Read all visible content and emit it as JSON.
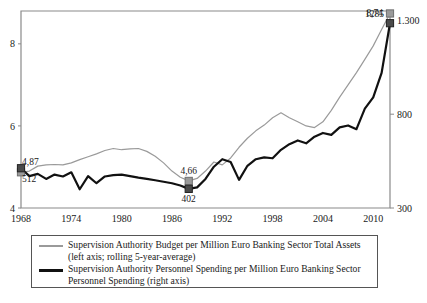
{
  "chart_data": {
    "type": "line",
    "title": "",
    "subtitle": "",
    "xlabel": "",
    "ylabel": "",
    "grid": false,
    "legend_position": "bottom",
    "xlim": [
      1968,
      2012
    ],
    "x_ticks": [
      1968,
      1974,
      1980,
      1986,
      1992,
      1998,
      2004,
      2010
    ],
    "x_tick_labels": [
      "1968",
      "1974",
      "1980",
      "1986",
      "1992",
      "1998",
      "2004",
      "2010"
    ],
    "left_axis": {
      "ylim": [
        4,
        8.8
      ],
      "ticks": [
        4,
        6,
        8
      ],
      "tick_labels": [
        "4",
        "6",
        "8"
      ]
    },
    "right_axis": {
      "ylim": [
        300,
        1350
      ],
      "ticks": [
        300,
        800,
        1300
      ],
      "tick_labels": [
        "300",
        "800",
        "1.300"
      ]
    },
    "series": [
      {
        "name": "Supervision Authority Budget per Million Euro Banking Sector Total Assets",
        "axis": "left",
        "color": "#9a9a9a",
        "x": [
          1968,
          1969,
          1970,
          1971,
          1972,
          1973,
          1974,
          1975,
          1976,
          1977,
          1978,
          1979,
          1980,
          1981,
          1982,
          1983,
          1984,
          1985,
          1986,
          1987,
          1988,
          1989,
          1990,
          1991,
          1992,
          1993,
          1994,
          1995,
          1996,
          1997,
          1998,
          1999,
          2000,
          2001,
          2002,
          2003,
          2004,
          2005,
          2006,
          2007,
          2008,
          2009,
          2010,
          2011,
          2012
        ],
        "values": [
          4.87,
          4.9,
          5.02,
          5.05,
          5.06,
          5.05,
          5.1,
          5.18,
          5.25,
          5.32,
          5.4,
          5.45,
          5.42,
          5.44,
          5.45,
          5.38,
          5.26,
          5.1,
          4.9,
          4.75,
          4.66,
          4.72,
          4.9,
          5.12,
          5.05,
          5.22,
          5.48,
          5.7,
          5.88,
          6.02,
          6.2,
          6.32,
          6.2,
          6.1,
          6.0,
          5.96,
          6.1,
          6.38,
          6.7,
          7.0,
          7.3,
          7.62,
          7.95,
          8.35,
          8.74
        ]
      },
      {
        "name": "Supervision Authority Personnel Spending per Million Euro Banking Sector Personnel Spending",
        "axis": "right",
        "color": "#111111",
        "x": [
          1968,
          1969,
          1970,
          1971,
          1972,
          1973,
          1974,
          1975,
          1976,
          1977,
          1978,
          1979,
          1980,
          1981,
          1982,
          1983,
          1984,
          1985,
          1986,
          1987,
          1988,
          1989,
          1990,
          1991,
          1992,
          1993,
          1994,
          1995,
          1996,
          1997,
          1998,
          1999,
          2000,
          2001,
          2002,
          2003,
          2004,
          2005,
          2006,
          2007,
          2008,
          2009,
          2010,
          2011,
          2012
        ],
        "values": [
          512,
          470,
          482,
          455,
          478,
          468,
          490,
          400,
          470,
          432,
          468,
          475,
          478,
          470,
          462,
          455,
          448,
          440,
          432,
          420,
          402,
          410,
          455,
          520,
          560,
          545,
          450,
          525,
          560,
          570,
          565,
          610,
          640,
          660,
          645,
          680,
          700,
          690,
          730,
          740,
          720,
          830,
          890,
          1020,
          1285
        ]
      }
    ],
    "annotations": [
      {
        "text": "4,87",
        "series": "left",
        "x": 1968,
        "value": 4.87,
        "marker": "gray-square",
        "label_pos": "above-right"
      },
      {
        "text": "512",
        "series": "right",
        "x": 1968,
        "value": 512,
        "marker": "dark-square",
        "label_pos": "below-right"
      },
      {
        "text": "4,66",
        "series": "left",
        "x": 1988,
        "value": 4.66,
        "marker": "gray-square",
        "label_pos": "above"
      },
      {
        "text": "402",
        "series": "right",
        "x": 1988,
        "value": 402,
        "marker": "dark-square",
        "label_pos": "below"
      },
      {
        "text": "8,74",
        "series": "left",
        "x": 2012,
        "value": 8.74,
        "marker": "gray-square",
        "label_pos": "left"
      },
      {
        "text": "1285",
        "series": "right",
        "x": 2012,
        "value": 1285,
        "marker": "dark-square",
        "label_pos": "above-left"
      }
    ]
  },
  "legend": {
    "entries": [
      {
        "line1": "Supervision Authority Budget per Million Euro Banking Sector Total Assets",
        "line2": "(left axis; rolling 5-year-average)",
        "swatch": "gray-line-swatch"
      },
      {
        "line1": "Supervision Authority Personnel Spending per Million Euro Banking Sector",
        "line2": "Personnel Spending (right axis)",
        "swatch": "dark-line-swatch"
      }
    ]
  },
  "colors": {
    "series_left": "#9a9a9a",
    "series_right": "#111111",
    "axis": "#8a8a8a",
    "text": "#1a1a1a"
  }
}
